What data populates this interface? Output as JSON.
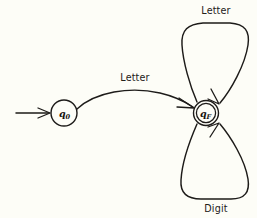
{
  "diagram": {
    "type": "state-transition-diagram",
    "background_color": "#fdfdf7",
    "ink_color": "#1d1b19"
  },
  "states": [
    {
      "id": "q0",
      "name": "q",
      "subscript": "0",
      "kind": "start",
      "accepting": false,
      "cx": 64,
      "cy": 113,
      "r": 13
    },
    {
      "id": "qF",
      "name": "q",
      "subscript": "F",
      "kind": "final",
      "accepting": true,
      "cx": 206,
      "cy": 113,
      "r": 12.5,
      "inner_r": 9.5
    }
  ],
  "start_marker": {
    "label": "start-arrow",
    "from_x": 16,
    "to_x": 50,
    "y": 113
  },
  "transitions": [
    {
      "id": "t-q0-qF",
      "label": "Letter",
      "from": "q0",
      "to": "qF",
      "kind": "curved-edge",
      "label_x": 135,
      "label_y": 81
    },
    {
      "id": "t-qF-qF-letter",
      "label": "Letter",
      "from": "qF",
      "to": "qF",
      "kind": "self-loop-top",
      "label_x": 216,
      "label_y": 14
    },
    {
      "id": "t-qF-qF-digit",
      "label": "Digit",
      "from": "qF",
      "to": "qF",
      "kind": "self-loop-bottom",
      "label_x": 216,
      "label_y": 210
    }
  ],
  "labels": {
    "edge_letter": "Letter",
    "loop_top_letter": "Letter",
    "loop_bottom_digit": "Digit",
    "state_q0_name": "q",
    "state_q0_sub": "0",
    "state_qF_name": "q",
    "state_qF_sub": "F"
  }
}
